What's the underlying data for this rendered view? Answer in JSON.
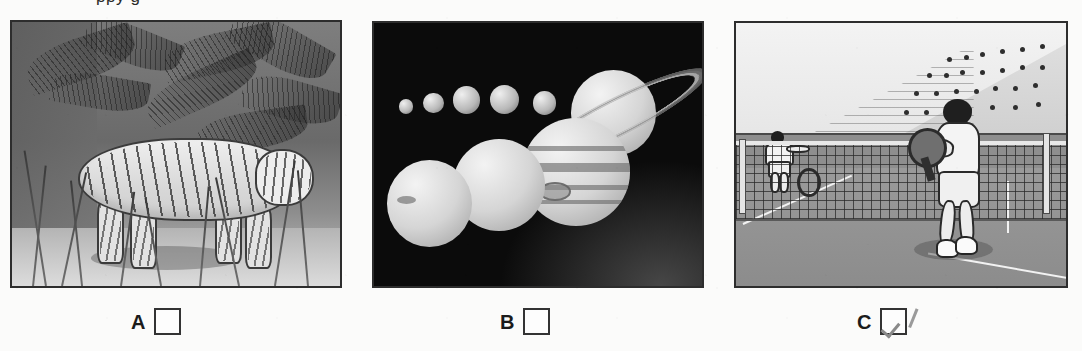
{
  "document": {
    "type": "worksheet",
    "cropped_heading_text": "ppy g",
    "background_color": "#fbfbfa",
    "frame_border_color": "#2d2d2d"
  },
  "options": [
    {
      "id": "A",
      "letter": "A",
      "checked": false,
      "picture": {
        "name": "jungle-tiger-illustration",
        "subject": "tiger walking through jungle undergrowth",
        "palette": "grayscale",
        "elements": [
          "tiger",
          "palm fronds",
          "tall grass",
          "jungle foliage",
          "ground shadow"
        ]
      }
    },
    {
      "id": "B",
      "letter": "B",
      "checked": false,
      "picture": {
        "name": "solar-system-planets-illustration",
        "subject": "planets of the solar system on black space background",
        "palette": "grayscale",
        "elements": [
          "five small rocky planets",
          "Saturn with rings",
          "Jupiter with great red spot",
          "Uranus",
          "Neptune"
        ]
      }
    },
    {
      "id": "C",
      "letter": "C",
      "checked": true,
      "picture": {
        "name": "tennis-match-illustration",
        "subject": "tennis player at the net in a stadium with crowd",
        "palette": "grayscale",
        "elements": [
          "near player with racket",
          "far opponent player",
          "tennis net",
          "court lines",
          "stadium stand",
          "crowd"
        ]
      }
    }
  ],
  "checkbox": {
    "checked_mark": "checkmark",
    "check_color": "#8a8a8a",
    "box_border_color": "#333333",
    "box_fill_color": "#fdfdfd"
  }
}
